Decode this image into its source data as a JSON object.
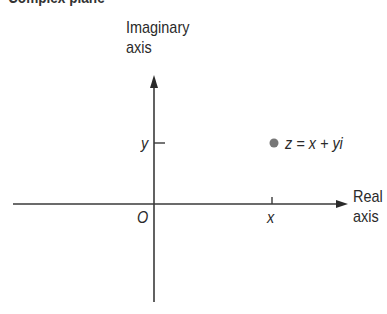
{
  "title": "Complex plane",
  "axes": {
    "imaginary_label_line1": "Imaginary",
    "imaginary_label_line2": "axis",
    "real_label_line1": "Real",
    "real_label_line2": "axis"
  },
  "ticks": {
    "origin": "O",
    "x": "x",
    "y": "y"
  },
  "point": {
    "label": "z = x + yi",
    "color": "#777777"
  }
}
